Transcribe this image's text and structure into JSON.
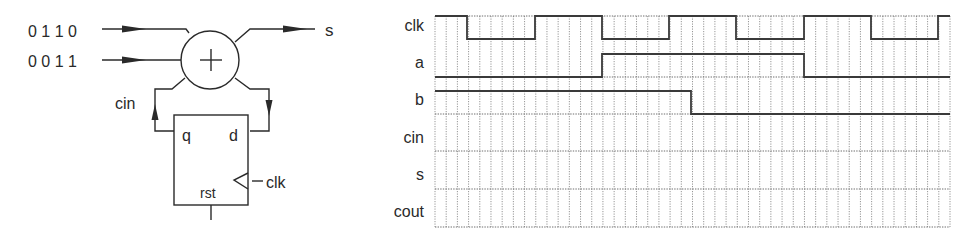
{
  "circuit": {
    "input_a_label": "0 1 1 0",
    "input_b_label": "0 0 1 1",
    "output_label": "s",
    "adder_symbol": "+",
    "carry_in_label": "cin",
    "flipflop": {
      "q_label": "q",
      "d_label": "d",
      "clk_label": "clk",
      "rst_label": "rst"
    }
  },
  "timing": {
    "signals": [
      {
        "name": "clk"
      },
      {
        "name": "a"
      },
      {
        "name": "b"
      },
      {
        "name": "cin"
      },
      {
        "name": "s"
      },
      {
        "name": "cout"
      }
    ],
    "grid": {
      "columns": 46,
      "x_start": 435,
      "x_end": 950,
      "row_lines_y": [
        16,
        77,
        114,
        151,
        189,
        227
      ]
    },
    "waves": {
      "clk": {
        "period_columns": 12,
        "high_columns": 3,
        "start_high": true,
        "transitions_x": [
          467,
          535,
          602,
          669,
          736,
          804,
          871,
          938
        ]
      },
      "a": {
        "initial": 0,
        "transitions_x": [
          602,
          804
        ],
        "values_after": [
          1,
          0
        ]
      },
      "b": {
        "initial": 1,
        "transitions_x": [
          691
        ],
        "values_after": [
          0
        ]
      },
      "cin": {
        "initial": null,
        "note": "blank"
      },
      "s": {
        "initial": null,
        "note": "blank"
      },
      "cout": {
        "initial": null,
        "note": "blank"
      }
    }
  }
}
